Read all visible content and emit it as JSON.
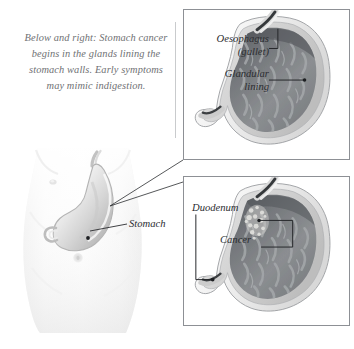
{
  "figure": {
    "background_color": "#ffffff"
  },
  "caption": {
    "text": "Below and right: Stomach cancer begins in the glands lining the stomach walls. Early symptoms may mimic indigestion.",
    "color": "#6f7174"
  },
  "torso": {
    "label": "Stomach",
    "organ_name": "stomach",
    "body_region": "abdomen"
  },
  "panels": [
    {
      "id": "panel-top",
      "name": "stomach-cross-section-normal",
      "labels": [
        {
          "name": "oesophagus",
          "text": "Oesophagus\n(gullet)",
          "line1": "Oesophagus",
          "line2": "(gullet)"
        },
        {
          "name": "glandular-lining",
          "text": "Glandular lining",
          "line1": "Glandular",
          "line2": "lining"
        }
      ]
    },
    {
      "id": "panel-bottom",
      "name": "stomach-cross-section-cancer",
      "labels": [
        {
          "name": "duodenum",
          "text": "Duodenum",
          "line1": "Duodenum",
          "line2": ""
        },
        {
          "name": "cancer",
          "text": "Cancer",
          "line1": "Cancer",
          "line2": ""
        }
      ]
    }
  ],
  "labels": {
    "oesophagus_line1": "Oesophagus",
    "oesophagus_line2": "(gullet)",
    "glandular_line1": "Glandular",
    "glandular_line2": "lining",
    "duodenum": "Duodenum",
    "cancer": "Cancer",
    "stomach": "Stomach"
  },
  "colors": {
    "panel_border": "#8d9095",
    "caption_text": "#6f7174",
    "label_text": "#2b2d30",
    "leader_line": "#2b2d30",
    "stomach_interior": "#8a8d90",
    "stomach_interior_dark": "#6b6e72",
    "stomach_wall_outer": "#e9e9ea",
    "stomach_wall_mid": "#c9cacb",
    "oesophagus_dark": "#3a3c3f",
    "torso_skin": "#f3f3f3",
    "torso_shade": "#dedede",
    "cancer_lesion": "#d9d9d7"
  }
}
